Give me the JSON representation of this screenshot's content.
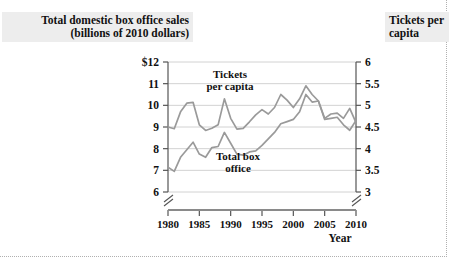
{
  "titles": {
    "left": "Total domestic box office sales\n(billions of 2010 dollars)",
    "right": "Tickets per\ncapita"
  },
  "axis": {
    "x_label": "Year",
    "x_ticks": [
      "1980",
      "1985",
      "1990",
      "1995",
      "2000",
      "2005",
      "2010"
    ],
    "y_left_ticks": [
      "$12",
      "11",
      "10",
      "9",
      "8",
      "7",
      "6"
    ],
    "y_right_ticks": [
      "6",
      "5.5",
      "5",
      "4.5",
      "4",
      "3.5",
      "3"
    ]
  },
  "series_labels": {
    "tickets_line1": "Tickets",
    "tickets_line2": "per capita",
    "boxoffice_line1": "Total box",
    "boxoffice_line2": "office"
  },
  "colors": {
    "line": "#9a9a9a",
    "grid": "#d2d2d2",
    "axis": "#555555",
    "title_bg": "#ededed",
    "text": "#111111"
  },
  "chart_data": {
    "type": "line",
    "xlabel": "Year",
    "ylabel": "Total domestic box office sales (billions of 2010 dollars)",
    "y2label": "Tickets per capita",
    "xlim": [
      1980,
      2010
    ],
    "ylim": [
      6,
      12
    ],
    "y2lim": [
      3,
      6
    ],
    "grid": true,
    "axis_break_left": true,
    "axis_break_right": true,
    "legend": "inline-annotations",
    "x": [
      1980,
      1981,
      1982,
      1983,
      1984,
      1985,
      1986,
      1987,
      1988,
      1989,
      1990,
      1991,
      1992,
      1993,
      1994,
      1995,
      1996,
      1997,
      1998,
      1999,
      2000,
      2001,
      2002,
      2003,
      2004,
      2005,
      2006,
      2007,
      2008,
      2009,
      2010
    ],
    "series": [
      {
        "name": "Tickets per capita",
        "axis": "right",
        "units": "tickets per person per year",
        "values": [
          4.5,
          4.46,
          4.85,
          5.05,
          5.07,
          4.55,
          4.42,
          4.47,
          4.55,
          5.15,
          4.7,
          4.45,
          4.47,
          4.62,
          4.78,
          4.9,
          4.8,
          4.95,
          5.25,
          5.12,
          4.95,
          5.15,
          5.45,
          5.25,
          5.1,
          4.7,
          4.8,
          4.82,
          4.7,
          4.93,
          4.6
        ]
      },
      {
        "name": "Total box office",
        "axis": "left",
        "units": "billions of 2010 dollars",
        "values": [
          7.15,
          6.95,
          7.6,
          7.95,
          8.3,
          7.75,
          7.6,
          8.05,
          8.1,
          8.75,
          8.25,
          7.75,
          7.7,
          7.85,
          7.9,
          8.15,
          8.45,
          8.75,
          9.15,
          9.25,
          9.35,
          9.7,
          10.5,
          10.15,
          10.2,
          9.35,
          9.4,
          9.45,
          9.1,
          8.85,
          9.3
        ]
      }
    ]
  }
}
